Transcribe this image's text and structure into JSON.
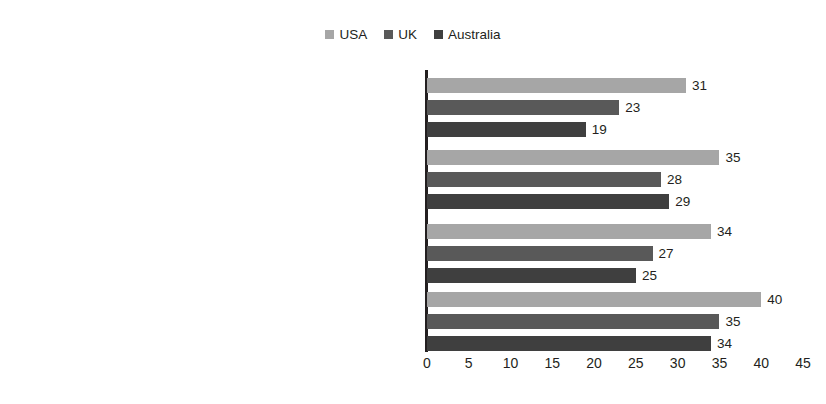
{
  "chart_data": {
    "type": "bar",
    "orientation": "horizontal",
    "title": "",
    "subtitle": "",
    "xlabel": "",
    "ylabel": "",
    "xlim": [
      0,
      45
    ],
    "xticks": [
      "0",
      "5",
      "10",
      "15",
      "20",
      "25",
      "30",
      "35",
      "40",
      "45"
    ],
    "grid": false,
    "legend_position": "top-center",
    "categories": [
      "Encourage other people to vote, or vote in a particular way",
      "Encourage others to take action on political or social issue",
      "Post links to political articles",
      "Post comments on politics or social issues"
    ],
    "series": [
      {
        "name": "USA",
        "color": "#a6a6a6",
        "values": [
          31,
          35,
          34,
          40
        ]
      },
      {
        "name": "UK",
        "color": "#595959",
        "values": [
          23,
          28,
          27,
          35
        ]
      },
      {
        "name": "Australia",
        "color": "#3f3f3f",
        "values": [
          19,
          29,
          25,
          34
        ]
      }
    ]
  },
  "legend": {
    "entries": [
      {
        "label": "USA",
        "swatch_name": "legend-swatch-usa"
      },
      {
        "label": "UK",
        "swatch_name": "legend-swatch-uk"
      },
      {
        "label": "Australia",
        "swatch_name": "legend-swatch-australia"
      }
    ]
  },
  "axis": {
    "baseline_value": "0"
  }
}
